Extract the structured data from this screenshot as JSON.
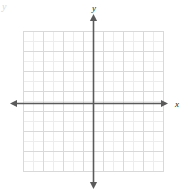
{
  "figure": {
    "type": "coordinate-plane",
    "background_color": "#ffffff",
    "axis_color": "#5a5a5a",
    "major_grid_color": "#d9d9d9",
    "minor_grid_color": "#ededed",
    "label_color": "#1a1a1a"
  },
  "axes": {
    "x_label": "x",
    "y_label": "y",
    "origin": {
      "x": 93,
      "y": 103
    },
    "x_axis": {
      "start_x": 10,
      "end_x": 168,
      "y": 103,
      "arrows": "both"
    },
    "y_axis": {
      "x": 93,
      "start_y": 14,
      "end_y": 189,
      "arrows": "both"
    }
  },
  "grid": {
    "left": 23,
    "top": 31,
    "right": 163,
    "bottom": 172,
    "cell_size": 10,
    "columns": 14,
    "rows": 14,
    "major_every": 2,
    "grid_visible": true,
    "tick_labels_visible": false
  },
  "artifact": {
    "top_left_mark": "y"
  },
  "chart_data": {
    "type": "scatter",
    "title": "",
    "xlabel": "x",
    "ylabel": "y",
    "series": [],
    "x": [],
    "values": [],
    "xlim": [
      -7,
      7
    ],
    "ylim": [
      -6.8,
      7.2
    ],
    "grid": true,
    "legend": "none",
    "annotations": []
  }
}
